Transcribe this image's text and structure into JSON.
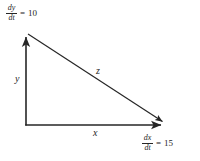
{
  "figure": {
    "type": "geometry-diagram",
    "background_color": "#ffffff",
    "stroke_color": "#262626"
  },
  "labels": {
    "leg_vertical": "y",
    "leg_horizontal": "x",
    "hypotenuse": "z"
  },
  "rates": {
    "dy": {
      "numerator": "dy",
      "denominator": "dt",
      "equals": "=",
      "value": "10"
    },
    "dx": {
      "numerator": "dx",
      "denominator": "dt",
      "equals": "=",
      "value": "15"
    }
  },
  "geometry": {
    "origin": {
      "x": 26,
      "y": 125
    },
    "top_vertex": {
      "x": 26,
      "y": 32
    },
    "right_vertex": {
      "x": 167,
      "y": 125
    },
    "vertical_arrow": "up",
    "horizontal_arrow": "right",
    "hypotenuse_arrow": "down-right"
  }
}
